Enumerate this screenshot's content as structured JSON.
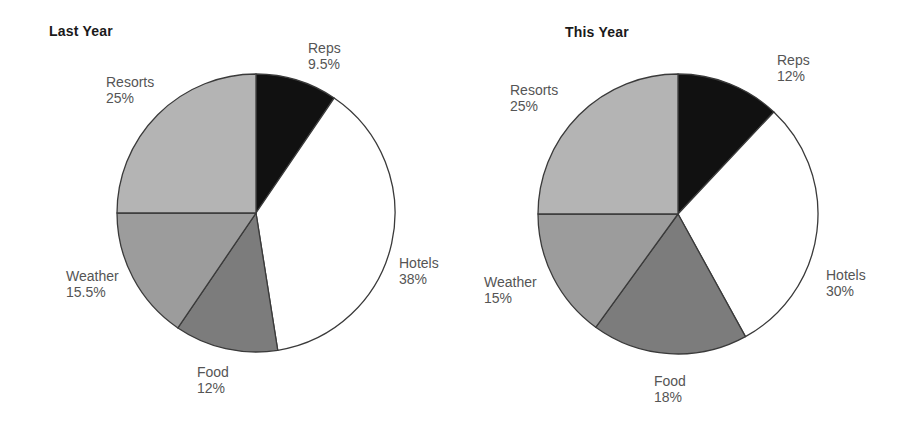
{
  "chart_data": [
    {
      "type": "pie",
      "title": "Last Year",
      "start_angle": "12 o'clock, clockwise",
      "categories": [
        "Reps",
        "Hotels",
        "Food",
        "Weather",
        "Resorts"
      ],
      "values": [
        9.5,
        38,
        12,
        15.5,
        25
      ],
      "labels": [
        "9.5%",
        "38%",
        "12%",
        "15.5%",
        "25%"
      ],
      "colors": [
        "#111111",
        "#ffffff",
        "#7c7c7c",
        "#9c9c9c",
        "#b4b4b4"
      ],
      "legend": "none (direct slice labels)"
    },
    {
      "type": "pie",
      "title": "This Year",
      "start_angle": "12 o'clock, clockwise",
      "categories": [
        "Reps",
        "Hotels",
        "Food",
        "Weather",
        "Resorts"
      ],
      "values": [
        12,
        30,
        18,
        15,
        25
      ],
      "labels": [
        "12%",
        "30%",
        "18%",
        "15%",
        "25%"
      ],
      "colors": [
        "#111111",
        "#ffffff",
        "#7c7c7c",
        "#9c9c9c",
        "#b4b4b4"
      ],
      "legend": "none (direct slice labels)"
    }
  ],
  "left": {
    "title": "Last Year",
    "slices": {
      "reps": {
        "name": "Reps",
        "pct": "9.5%"
      },
      "hotels": {
        "name": "Hotels",
        "pct": "38%"
      },
      "food": {
        "name": "Food",
        "pct": "12%"
      },
      "weather": {
        "name": "Weather",
        "pct": "15.5%"
      },
      "resorts": {
        "name": "Resorts",
        "pct": "25%"
      }
    }
  },
  "right": {
    "title": "This Year",
    "slices": {
      "reps": {
        "name": "Reps",
        "pct": "12%"
      },
      "hotels": {
        "name": "Hotels",
        "pct": "30%"
      },
      "food": {
        "name": "Food",
        "pct": "18%"
      },
      "weather": {
        "name": "Weather",
        "pct": "15%"
      },
      "resorts": {
        "name": "Resorts",
        "pct": "25%"
      }
    }
  },
  "style": {
    "stroke": "#3a3a3a",
    "label_color": "#555555",
    "title_color": "#1a1a1a"
  }
}
